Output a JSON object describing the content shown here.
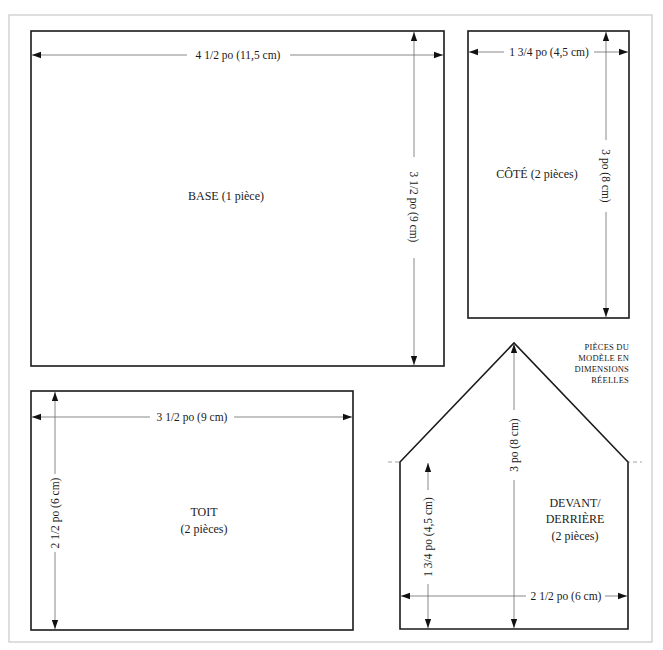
{
  "pieces": {
    "base": {
      "title": "BASE (1 pièce)",
      "width_label": "4 1/2 po (11,5 cm)",
      "height_label": "3 1/2 po (9 cm)"
    },
    "cote": {
      "title": "CÔTÉ (2 pièces)",
      "width_label": "1 3/4 po (4,5 cm)",
      "height_label": "3 po (8 cm)"
    },
    "toit": {
      "title_line1": "TOIT",
      "title_line2": "(2 pièces)",
      "width_label": "3 1/2 po (9 cm)",
      "height_label": "2 1/2 po (6 cm)"
    },
    "devant": {
      "title_line1": "DEVANT/",
      "title_line2": "DERRIÈRE",
      "title_line3": "(2 pièces)",
      "width_label": "2 1/2 po (6 cm)",
      "total_height_label": "3 po (8 cm)",
      "wall_height_label": "1 3/4 po (4,5 cm)"
    }
  },
  "note": {
    "line1": "PIÈCES DU",
    "line2": "MODÈLE EN",
    "line3": "DIMENSIONS",
    "line4": "RÉELLES"
  },
  "colors": {
    "outline": "#1a1a1a",
    "dimension_line": "#6a6a6a",
    "frame": "#c8c8c8",
    "background": "#ffffff"
  }
}
